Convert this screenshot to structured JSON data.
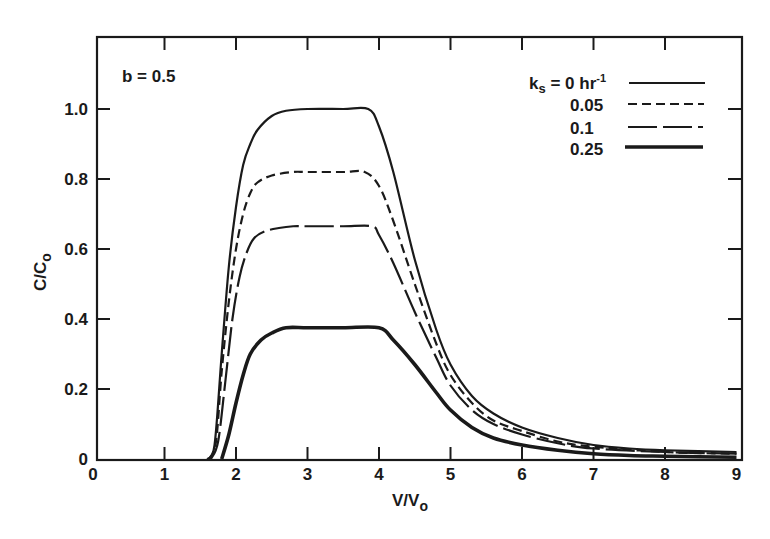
{
  "chart_data": {
    "type": "line",
    "title": "",
    "annotation": "b = 0.5",
    "xlabel": "V/V",
    "xlabel_sub": "o",
    "ylabel": "C/C",
    "ylabel_sub": "o",
    "xlim": [
      0,
      9
    ],
    "ylim": [
      0,
      1.2
    ],
    "x_ticks": [
      "0",
      "1",
      "2",
      "3",
      "4",
      "5",
      "6",
      "7",
      "8",
      "9"
    ],
    "y_ticks": [
      "0",
      "0.2",
      "0.4",
      "0.6",
      "0.8",
      "1.0"
    ],
    "grid": false,
    "legend_position": "upper right",
    "legend_title_prefix": "k",
    "legend_title_sub": "s",
    "series": [
      {
        "name": "ks = 0 hr-1",
        "legend_label": " = 0 hr",
        "legend_sup": "-1",
        "style": "solid-thin",
        "x": [
          1.6,
          1.7,
          1.8,
          1.9,
          2.0,
          2.1,
          2.2,
          2.3,
          2.5,
          2.7,
          3.0,
          3.5,
          3.85,
          4.0,
          4.2,
          4.5,
          4.8,
          5.0,
          5.3,
          5.6,
          6.0,
          6.5,
          7.0,
          7.5,
          8.0,
          9.0
        ],
        "y": [
          0.0,
          0.04,
          0.3,
          0.55,
          0.72,
          0.84,
          0.9,
          0.94,
          0.98,
          0.995,
          1.0,
          1.0,
          1.0,
          0.95,
          0.82,
          0.57,
          0.37,
          0.27,
          0.18,
          0.13,
          0.09,
          0.06,
          0.04,
          0.03,
          0.025,
          0.02
        ]
      },
      {
        "name": "0.05",
        "legend_label": "0.05",
        "style": "dashed-short",
        "x": [
          1.62,
          1.72,
          1.8,
          1.9,
          2.0,
          2.1,
          2.2,
          2.3,
          2.5,
          2.8,
          3.0,
          3.5,
          3.8,
          4.0,
          4.2,
          4.5,
          4.8,
          5.0,
          5.3,
          5.6,
          6.0,
          6.5,
          7.0,
          8.0,
          9.0
        ],
        "y": [
          0.0,
          0.05,
          0.25,
          0.45,
          0.6,
          0.7,
          0.76,
          0.79,
          0.81,
          0.82,
          0.82,
          0.82,
          0.82,
          0.78,
          0.68,
          0.5,
          0.33,
          0.24,
          0.16,
          0.11,
          0.08,
          0.05,
          0.035,
          0.02,
          0.015
        ]
      },
      {
        "name": "0.1",
        "legend_label": "0.1",
        "style": "dashed-long",
        "x": [
          1.65,
          1.75,
          1.85,
          1.95,
          2.05,
          2.15,
          2.25,
          2.4,
          2.6,
          2.8,
          3.0,
          3.5,
          3.9,
          4.0,
          4.2,
          4.5,
          4.8,
          5.0,
          5.3,
          5.6,
          6.0,
          6.5,
          7.0,
          8.0,
          9.0
        ],
        "y": [
          0.0,
          0.05,
          0.22,
          0.4,
          0.52,
          0.59,
          0.63,
          0.65,
          0.66,
          0.665,
          0.665,
          0.665,
          0.665,
          0.64,
          0.56,
          0.42,
          0.29,
          0.21,
          0.14,
          0.1,
          0.07,
          0.045,
          0.03,
          0.02,
          0.015
        ]
      },
      {
        "name": "0.25",
        "legend_label": "0.25",
        "style": "solid-thick",
        "x": [
          1.8,
          1.9,
          2.0,
          2.1,
          2.2,
          2.35,
          2.5,
          2.7,
          3.0,
          3.5,
          4.0,
          4.2,
          4.5,
          4.8,
          5.0,
          5.3,
          5.6,
          6.0,
          6.5,
          7.0,
          7.5,
          8.0,
          9.0
        ],
        "y": [
          0.0,
          0.07,
          0.16,
          0.24,
          0.3,
          0.34,
          0.36,
          0.375,
          0.375,
          0.375,
          0.375,
          0.34,
          0.27,
          0.19,
          0.14,
          0.09,
          0.06,
          0.04,
          0.025,
          0.015,
          0.01,
          0.008,
          0.005
        ]
      }
    ]
  }
}
